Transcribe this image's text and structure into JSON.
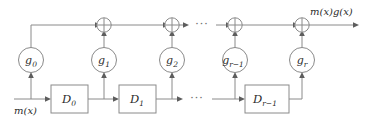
{
  "diagram": {
    "input_label": "m(x)",
    "output_label": "m(x)g(x)",
    "ellipsis": "···",
    "colors": {
      "wire": "#8a8a8a",
      "arrow": "#5d5d5d",
      "text": "#2b2b2b",
      "background": "#ffffff"
    },
    "taps": [
      {
        "id": "g0",
        "base": "g",
        "sub": "0",
        "label": "g0"
      },
      {
        "id": "g1",
        "base": "g",
        "sub": "1",
        "label": "g1"
      },
      {
        "id": "g2",
        "base": "g",
        "sub": "2",
        "label": "g2"
      },
      {
        "id": "gr1",
        "base": "g",
        "sub": "r−1",
        "label": "gr-1"
      },
      {
        "id": "gr",
        "base": "g",
        "sub": "r",
        "label": "gr"
      }
    ],
    "delays": [
      {
        "id": "D0",
        "base": "D",
        "sub": "0",
        "label": "D0"
      },
      {
        "id": "D1",
        "base": "D",
        "sub": "1",
        "label": "D1"
      },
      {
        "id": "Dr1",
        "base": "D",
        "sub": "r−1",
        "label": "Dr-1"
      }
    ],
    "adders": [
      {
        "id": "adder1",
        "symbol": "⊕"
      },
      {
        "id": "adder2",
        "symbol": "⊕"
      },
      {
        "id": "adder3",
        "symbol": "⊕"
      },
      {
        "id": "adder4",
        "symbol": "⊕"
      }
    ]
  }
}
